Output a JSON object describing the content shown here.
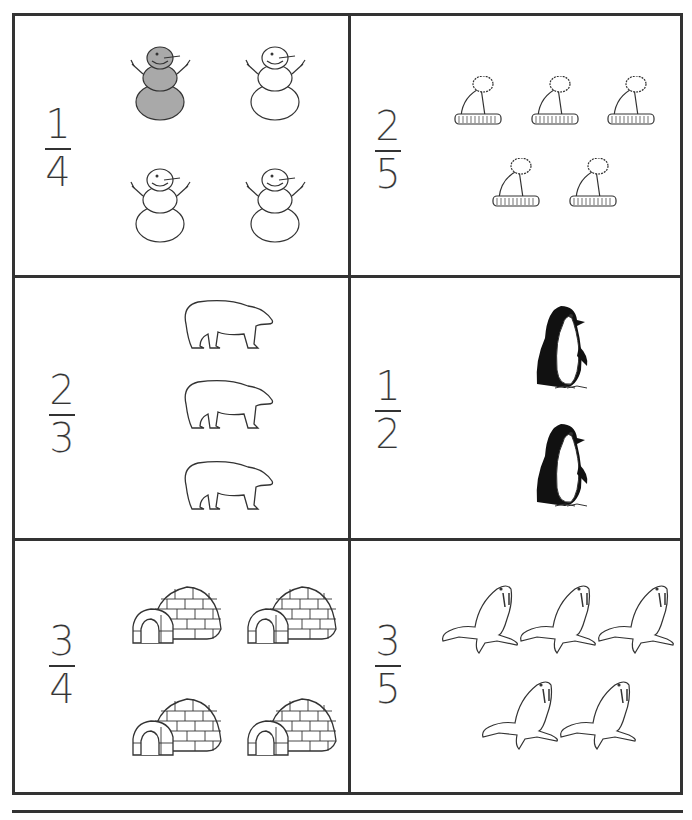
{
  "worksheet": {
    "cells": [
      {
        "numerator": "1",
        "denominator": "4",
        "picture": "snowman",
        "count": 4,
        "shaded": 1
      },
      {
        "numerator": "2",
        "denominator": "5",
        "picture": "winter-hat",
        "count": 5,
        "shaded": 0
      },
      {
        "numerator": "2",
        "denominator": "3",
        "picture": "polar-bear",
        "count": 3,
        "shaded": 0
      },
      {
        "numerator": "1",
        "denominator": "2",
        "picture": "penguin",
        "count": 2,
        "shaded": 0
      },
      {
        "numerator": "3",
        "denominator": "4",
        "picture": "igloo",
        "count": 4,
        "shaded": 0
      },
      {
        "numerator": "3",
        "denominator": "5",
        "picture": "walrus",
        "count": 5,
        "shaded": 0
      }
    ]
  },
  "colors": {
    "border": "#333333",
    "shade": "#a9a9a9",
    "line": "#333333"
  }
}
